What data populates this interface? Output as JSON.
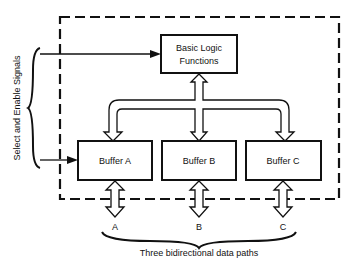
{
  "diagram": {
    "logic_block": {
      "line1": "Basic Logic",
      "line2": "Functions"
    },
    "buffers": [
      {
        "label": "Buffer A"
      },
      {
        "label": "Buffer B"
      },
      {
        "label": "Buffer C"
      }
    ],
    "path_labels": [
      "A",
      "B",
      "C"
    ],
    "side_label": "Select and Enable Signals",
    "bottom_caption": "Three bidirectional data paths",
    "colors": {
      "stroke": "#111111",
      "background": "#ffffff"
    }
  }
}
